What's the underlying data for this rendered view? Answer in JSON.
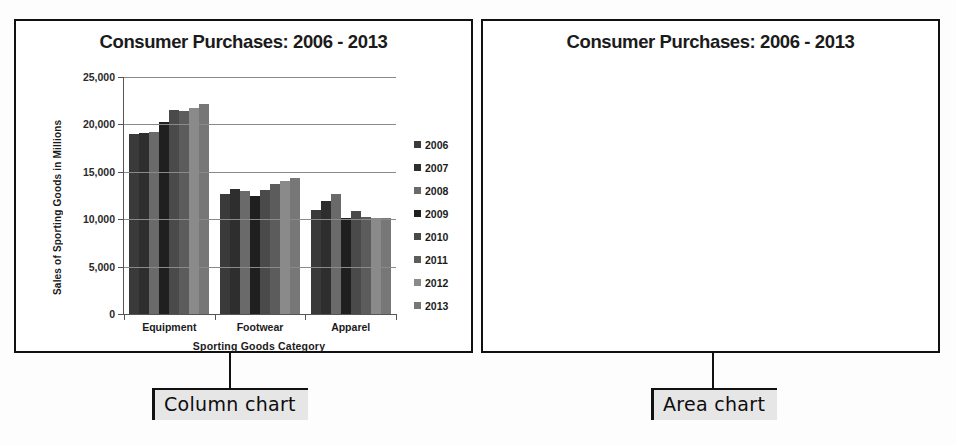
{
  "page": {
    "background": "#fdfdfd"
  },
  "callouts": {
    "column": "Column chart",
    "area": "Area chart"
  },
  "panels": {
    "left": {
      "title": "Consumer Purchases: 2006 - 2013",
      "kind": "column"
    },
    "right": {
      "title": "Consumer Purchases: 2006 - 2013",
      "kind": "area"
    }
  },
  "axis": {
    "y_title": "Sales of Sporting Goods  in Millions",
    "x_title": "Sporting Goods Category",
    "y_ticks": [
      "25,000",
      "20,000",
      "15,000",
      "10,000",
      "5,000",
      "0"
    ],
    "y_tick_values": [
      25000,
      20000,
      15000,
      10000,
      5000,
      0
    ]
  },
  "colors": {
    "series_2006": "#3a3a3a",
    "series_2007": "#2e2e2e",
    "series_2008": "#6a6a6a",
    "series_2009": "#1f1f1f",
    "series_2010": "#4a4a4a",
    "series_2011": "#5c5c5c",
    "series_2012": "#8a8a8a",
    "series_2013": "#777777",
    "equipment": "#2b2b2b",
    "footwear": "#474747",
    "apparel": "#8d8d8d",
    "panel_border": "#111111",
    "gridline": "#8a8a8a",
    "callout_bg": "#e6e6e6"
  },
  "chart_data": [
    {
      "type": "bar",
      "title": "Consumer Purchases: 2006 - 2013",
      "xlabel": "Sporting Goods Category",
      "ylabel": "Sales of Sporting Goods  in Millions",
      "ylim": [
        0,
        25000
      ],
      "ytick_step": 5000,
      "grid": true,
      "legend_position": "right",
      "categories": [
        "Equipment",
        "Footwear",
        "Apparel"
      ],
      "series": [
        {
          "name": "2006",
          "color": "#3a3a3a",
          "values": [
            18950,
            12700,
            11000
          ]
        },
        {
          "name": "2007",
          "color": "#2e2e2e",
          "values": [
            19050,
            13200,
            11950
          ]
        },
        {
          "name": "2008",
          "color": "#6a6a6a",
          "values": [
            19150,
            12950,
            12700
          ]
        },
        {
          "name": "2009",
          "color": "#1f1f1f",
          "values": [
            20250,
            12450,
            10150
          ]
        },
        {
          "name": "2010",
          "color": "#4a4a4a",
          "values": [
            21500,
            13050,
            10900
          ]
        },
        {
          "name": "2011",
          "color": "#5c5c5c",
          "values": [
            21450,
            13700,
            10200
          ]
        },
        {
          "name": "2012",
          "color": "#8a8a8a",
          "values": [
            21700,
            14050,
            10150
          ]
        },
        {
          "name": "2013",
          "color": "#777777",
          "values": [
            22200,
            14400,
            10100
          ]
        }
      ]
    },
    {
      "type": "area",
      "stacked": true,
      "title": "Consumer Purchases: 2006 - 2013",
      "xlabel": "Sporting Goods Category",
      "ylabel": "Sales of Sporting Goods in Millions",
      "ylim": [
        0,
        25000
      ],
      "ytick_step": 5000,
      "grid": true,
      "legend_position": "right",
      "x": [
        "2006",
        "2007",
        "2008",
        "2009",
        "2010",
        "2011",
        "2012",
        "2013"
      ],
      "series": [
        {
          "name": "Apparel",
          "color": "#8d8d8d",
          "values": [
            11000,
            11950,
            12700,
            10150,
            10900,
            10200,
            10150,
            10100
          ]
        },
        {
          "name": "Footwear",
          "color": "#474747",
          "values": [
            12700,
            13200,
            12950,
            12450,
            13050,
            13700,
            14050,
            14400
          ]
        },
        {
          "name": "Equipment",
          "color": "#2b2b2b",
          "values": [
            18950,
            19050,
            19150,
            20250,
            21500,
            21450,
            21700,
            22200
          ]
        }
      ],
      "legend_order": [
        "Equipment",
        "Footwear",
        "Apparel"
      ],
      "stack_totals": [
        18950,
        19050,
        19150,
        20250,
        21500,
        21450,
        21700,
        22200
      ],
      "apparel_top": [
        11000,
        11950,
        12700,
        10150,
        10900,
        10200,
        10150,
        10100
      ],
      "footwear_top": [
        15200,
        15500,
        15400,
        15300,
        15500,
        15600,
        15700,
        15900
      ]
    }
  ]
}
